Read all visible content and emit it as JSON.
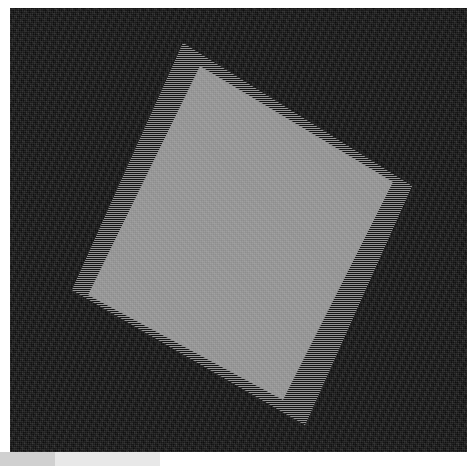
{
  "scene": {
    "title": "Rotated square on dark noisy background",
    "canvas": {
      "name": "image-canvas",
      "x": 10,
      "y": 8,
      "width": 457,
      "height": 444,
      "background_color": "#121212",
      "texture": "noise"
    },
    "shapes": [
      {
        "name": "rotated-square-antialias-band",
        "type": "quadrilateral",
        "fill_color": "#6a6a6a",
        "edge_style": "dithered-horizontal-stripes",
        "points": [
          [
            173,
            35
          ],
          [
            402,
            178
          ],
          [
            295,
            417
          ],
          [
            62,
            282
          ]
        ]
      },
      {
        "name": "rotated-square-fill",
        "type": "quadrilateral",
        "fill_color": "#9a9a9a",
        "edge_style": "solid",
        "points": [
          [
            190,
            58
          ],
          [
            383,
            174
          ],
          [
            273,
            392
          ],
          [
            78,
            287
          ]
        ]
      }
    ],
    "footer": {
      "name": "footer-strip",
      "left_block_color": "#d0d0d0",
      "right_block_color": "#e8e8e8",
      "y": 452,
      "height": 14
    }
  }
}
